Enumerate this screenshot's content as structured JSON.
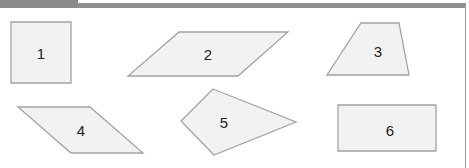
{
  "figure": {
    "header": {
      "tab_color": "#8a8a8a",
      "bar_color": "#8e8e8e"
    },
    "shapes": [
      {
        "id": "1",
        "label": "1",
        "kind": "square",
        "points": "11,22 71,22 71,83 11,83",
        "label_pos": [
          41,
          53
        ]
      },
      {
        "id": "2",
        "label": "2",
        "kind": "parallelogram",
        "points": "179,32 288,32 238,76 128,76",
        "label_pos": [
          208,
          54
        ]
      },
      {
        "id": "3",
        "label": "3",
        "kind": "trapezoid",
        "points": "361,23 399,23 409,75 327,75",
        "label_pos": [
          378,
          51
        ]
      },
      {
        "id": "4",
        "label": "4",
        "kind": "parallelogram",
        "points": "18,107 90,107 143,153 71,153",
        "label_pos": [
          81,
          130
        ]
      },
      {
        "id": "5",
        "label": "5",
        "kind": "kite",
        "points": "213,89 296,122 214,155 181,121",
        "label_pos": [
          224,
          122
        ]
      },
      {
        "id": "6",
        "label": "6",
        "kind": "rectangle",
        "points": "338,105 436,105 436,151 338,151",
        "label_pos": [
          390,
          130
        ]
      }
    ],
    "fill_color": "#f2f2f2",
    "stroke_color": "#a3a3a3"
  }
}
